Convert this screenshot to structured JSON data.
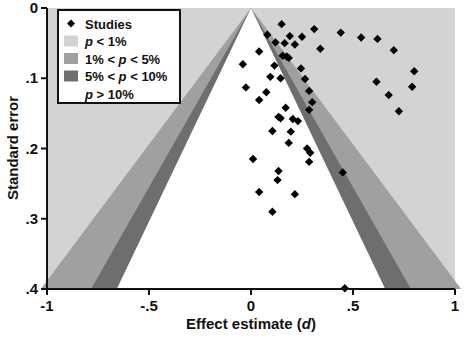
{
  "figure": {
    "type": "funnel-plot",
    "background": "#ffffff"
  },
  "axes": {
    "x": {
      "label_prefix": "Effect estimate (",
      "label_italic": "d",
      "label_suffix": ")",
      "label_full": "Effect estimate (d)",
      "ticks": [
        "-1",
        "-.5",
        "0",
        ".5",
        "1"
      ],
      "tick_values": [
        -1,
        -0.5,
        0,
        0.5,
        1
      ],
      "min": -1,
      "max": 1
    },
    "y": {
      "label": "Standard error",
      "ticks": [
        "0",
        ".1",
        ".2",
        ".3",
        ".4"
      ],
      "tick_values": [
        0,
        0.1,
        0.2,
        0.3,
        0.4
      ],
      "min": 0,
      "max": 0.4,
      "inverted": true
    }
  },
  "legend": {
    "items": [
      {
        "marker": "diamond-marker",
        "swatch": null,
        "label": "Studies",
        "label_pre": "",
        "label_ital": "",
        "label_post": "Studies"
      },
      {
        "marker": null,
        "swatch": "#d3d3d3",
        "label": "p < 1%",
        "label_pre": "",
        "label_ital": "p",
        "label_post": " < 1%"
      },
      {
        "marker": null,
        "swatch": "#a0a0a0",
        "label": "1% < p < 5%",
        "label_pre": "1% < ",
        "label_ital": "p",
        "label_post": " < 5%"
      },
      {
        "marker": null,
        "swatch": "#6e6e6e",
        "label": "5% < p < 10%",
        "label_pre": "5% < ",
        "label_ital": "p",
        "label_post": " < 10%"
      },
      {
        "marker": null,
        "swatch": "#ffffff",
        "label": "p > 10%",
        "label_pre": "",
        "label_ital": "p",
        "label_post": " > 10%"
      }
    ],
    "box_fill": "#ffffff",
    "box_stroke": "#111111"
  },
  "colors": {
    "band_p_lt_1": "#d3d3d3",
    "band_1_to_5": "#a0a0a0",
    "band_5_to_10": "#6e6e6e",
    "band_p_gt_10": "#ffffff",
    "marker": "#000000",
    "axis": "#111111"
  },
  "chart_data": {
    "type": "scatter",
    "title": "",
    "xlabel": "Effect estimate (d)",
    "ylabel": "Standard error",
    "xlim": [
      -1,
      1
    ],
    "ylim": [
      0.4,
      0
    ],
    "grid": false,
    "legend_position": "top-left",
    "series": [
      {
        "name": "Studies",
        "marker": "diamond",
        "color": "#000000",
        "points": [
          [
            0.79,
            0.112
          ],
          [
            0.15,
            0.023
          ],
          [
            0.31,
            0.03
          ],
          [
            0.44,
            0.035
          ],
          [
            0.08,
            0.038
          ],
          [
            0.19,
            0.04
          ],
          [
            0.25,
            0.041
          ],
          [
            0.54,
            0.042
          ],
          [
            0.62,
            0.044
          ],
          [
            0.12,
            0.049
          ],
          [
            0.165,
            0.05
          ],
          [
            0.215,
            0.052
          ],
          [
            0.34,
            0.058
          ],
          [
            0.7,
            0.06
          ],
          [
            0.04,
            0.062
          ],
          [
            0.155,
            0.068
          ],
          [
            0.175,
            0.069
          ],
          [
            0.185,
            0.071
          ],
          [
            -0.04,
            0.08
          ],
          [
            0.115,
            0.082
          ],
          [
            0.245,
            0.086
          ],
          [
            0.8,
            0.09
          ],
          [
            0.095,
            0.098
          ],
          [
            0.145,
            0.1
          ],
          [
            0.265,
            0.101
          ],
          [
            0.615,
            0.105
          ],
          [
            -0.025,
            0.113
          ],
          [
            0.285,
            0.118
          ],
          [
            0.075,
            0.12
          ],
          [
            0.675,
            0.124
          ],
          [
            0.04,
            0.131
          ],
          [
            0.3,
            0.134
          ],
          [
            0.17,
            0.142
          ],
          [
            0.285,
            0.145
          ],
          [
            0.725,
            0.147
          ],
          [
            0.135,
            0.155
          ],
          [
            0.145,
            0.157
          ],
          [
            0.205,
            0.158
          ],
          [
            0.23,
            0.161
          ],
          [
            0.105,
            0.175
          ],
          [
            0.195,
            0.176
          ],
          [
            0.185,
            0.192
          ],
          [
            0.275,
            0.2
          ],
          [
            0.29,
            0.206
          ],
          [
            0.01,
            0.215
          ],
          [
            0.285,
            0.219
          ],
          [
            0.135,
            0.232
          ],
          [
            0.45,
            0.234
          ],
          [
            0.13,
            0.245
          ],
          [
            0.04,
            0.262
          ],
          [
            0.215,
            0.265
          ],
          [
            0.105,
            0.29
          ],
          [
            0.46,
            0.399
          ]
        ]
      }
    ],
    "funnel": {
      "apex_x": 0.0,
      "apex_y": 0.0,
      "contour_levels": [
        {
          "label": "p > 10%",
          "z": 1.645,
          "fill": "#ffffff"
        },
        {
          "label": "5% < p < 10%",
          "z": 1.96,
          "fill": "#6e6e6e"
        },
        {
          "label": "1% < p < 5%",
          "z": 2.576,
          "fill": "#a0a0a0"
        },
        {
          "label": "p < 1%",
          "z": null,
          "fill": "#d3d3d3"
        }
      ]
    }
  }
}
